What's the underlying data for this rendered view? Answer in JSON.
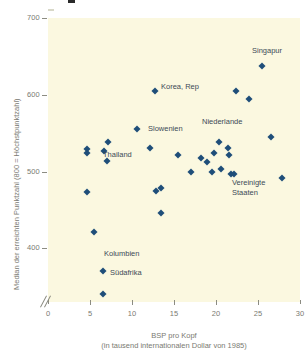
{
  "chart_data": {
    "type": "scatter",
    "title": "",
    "xlabel": "BSP pro Kopf",
    "xlabel_sub": "(in tausend internationalen Dollar von 1985)",
    "ylabel": "Median der erreichten Punktzahl (800 = Höchstpunktzahl)",
    "xlim": [
      0,
      30
    ],
    "ylim": [
      330,
      700
    ],
    "xticks": [
      "0",
      "5",
      "10",
      "15",
      "20",
      "25",
      "30"
    ],
    "xtick_values": [
      0,
      5,
      10,
      15,
      20,
      25,
      30
    ],
    "yticks": [
      "700",
      "600",
      "500",
      "400"
    ],
    "ytick_values": [
      700,
      600,
      500,
      400
    ],
    "grid": false,
    "legend": "none",
    "axis_break": true,
    "marker_color": "#1F4E79",
    "panel_color": "#FBF8E0",
    "points": [
      {
        "x": 4.6,
        "y": 529,
        "label": ""
      },
      {
        "x": 4.7,
        "y": 524,
        "label": ""
      },
      {
        "x": 4.6,
        "y": 473,
        "label": ""
      },
      {
        "x": 5.5,
        "y": 421,
        "label": ""
      },
      {
        "x": 6.6,
        "y": 340,
        "label": "Südafrika"
      },
      {
        "x": 6.5,
        "y": 371,
        "label": "Kolumbien"
      },
      {
        "x": 6.7,
        "y": 527,
        "label": ""
      },
      {
        "x": 7.1,
        "y": 539,
        "label": ""
      },
      {
        "x": 7.0,
        "y": 514,
        "label": "Thailand"
      },
      {
        "x": 10.6,
        "y": 556,
        "label": ""
      },
      {
        "x": 12.1,
        "y": 531,
        "label": "Slowenien"
      },
      {
        "x": 12.7,
        "y": 605,
        "label": "Korea, Rep"
      },
      {
        "x": 12.9,
        "y": 474,
        "label": ""
      },
      {
        "x": 13.4,
        "y": 446,
        "label": ""
      },
      {
        "x": 13.5,
        "y": 478,
        "label": ""
      },
      {
        "x": 15.5,
        "y": 521,
        "label": ""
      },
      {
        "x": 17.0,
        "y": 500,
        "label": ""
      },
      {
        "x": 18.2,
        "y": 518,
        "label": ""
      },
      {
        "x": 18.9,
        "y": 512,
        "label": ""
      },
      {
        "x": 19.5,
        "y": 499,
        "label": ""
      },
      {
        "x": 19.8,
        "y": 524,
        "label": ""
      },
      {
        "x": 20.4,
        "y": 539,
        "label": "Niederlande"
      },
      {
        "x": 20.6,
        "y": 503,
        "label": ""
      },
      {
        "x": 21.4,
        "y": 531,
        "label": ""
      },
      {
        "x": 21.5,
        "y": 522,
        "label": ""
      },
      {
        "x": 21.8,
        "y": 497,
        "label": ""
      },
      {
        "x": 22.2,
        "y": 497,
        "label": "Vereinigte Staaten"
      },
      {
        "x": 22.4,
        "y": 605,
        "label": ""
      },
      {
        "x": 23.9,
        "y": 594,
        "label": ""
      },
      {
        "x": 25.5,
        "y": 638,
        "label": "Singapur"
      },
      {
        "x": 26.6,
        "y": 545,
        "label": ""
      },
      {
        "x": 27.8,
        "y": 491,
        "label": ""
      }
    ],
    "annotations": [
      {
        "text": "Singapur",
        "x": 252,
        "y": 46
      },
      {
        "text": "Korea, Rep",
        "x": 161,
        "y": 82
      },
      {
        "text": "Niederlande",
        "x": 202,
        "y": 117
      },
      {
        "text": "Slowenien",
        "x": 148,
        "y": 124
      },
      {
        "text": "Thailand",
        "x": 103,
        "y": 150
      },
      {
        "text": "Vereinigte",
        "x": 232,
        "y": 178
      },
      {
        "text": "Staaten",
        "x": 232,
        "y": 188
      },
      {
        "text": "Kolumbien",
        "x": 104,
        "y": 249
      },
      {
        "text": "Südafrika",
        "x": 110,
        "y": 268
      }
    ]
  }
}
